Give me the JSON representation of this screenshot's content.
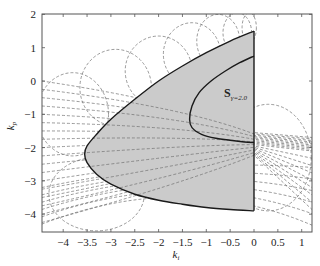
{
  "chart_data": {
    "type": "area",
    "title": "",
    "xlabel": "k_i",
    "ylabel": "k_p",
    "xlim": [
      -4.45,
      1.25
    ],
    "ylim": [
      -4.55,
      2.0
    ],
    "grid": false,
    "x_ticks": [
      "-4",
      "-3.5",
      "-3",
      "-2.5",
      "-2",
      "-1.5",
      "-1",
      "-0.5",
      "0",
      "0.5",
      "1"
    ],
    "y_ticks": [
      "2",
      "1",
      "0",
      "-1",
      "-2",
      "-3",
      "-4"
    ],
    "annotations": [
      {
        "text": "S",
        "subscript": "γ=2.0",
        "x": -0.3,
        "y": -0.5
      }
    ],
    "series": [
      {
        "name": "outer stability boundary",
        "style": "solid black",
        "x": [
          0,
          -0.5,
          -1.0,
          -1.5,
          -2.0,
          -2.5,
          -3.0,
          -3.3,
          -3.5,
          -3.55,
          -3.5,
          -3.3,
          -3.0,
          -2.5,
          -2.0,
          -1.5,
          -1.0,
          -0.5,
          0
        ],
        "y": [
          1.5,
          1.2,
          0.85,
          0.45,
          0.0,
          -0.55,
          -1.15,
          -1.6,
          -1.95,
          -2.2,
          -2.45,
          -2.8,
          -3.1,
          -3.4,
          -3.58,
          -3.7,
          -3.8,
          -3.86,
          -3.9
        ]
      },
      {
        "name": "inner stability boundary",
        "style": "solid black",
        "x": [
          0,
          -0.3,
          -0.6,
          -0.9,
          -1.15,
          -1.3,
          -1.35,
          -1.3,
          -1.1,
          -0.8,
          -0.5,
          -0.2,
          0
        ],
        "y": [
          0.75,
          0.55,
          0.3,
          0.0,
          -0.35,
          -0.75,
          -1.15,
          -1.4,
          -1.6,
          -1.72,
          -1.78,
          -1.83,
          -1.85
        ]
      }
    ],
    "shaded_region": "between outer boundary and k_i=0, excluding region enclosed by inner boundary upper part; fill #c8c8c8",
    "background_curves": "many dashed gray curves (family of arcs/ellipses) crossing the plot"
  },
  "colors": {
    "fill": "#cbcbcb",
    "boundary": "#1a1a1a",
    "dashed": "#6e6e6e",
    "axis": "#555555"
  }
}
